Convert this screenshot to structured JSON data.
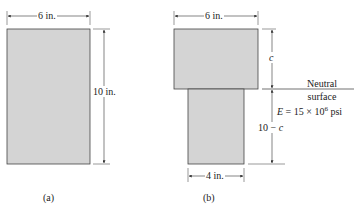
{
  "figure_a": {
    "caption": "(a)",
    "width_label": "6 in.",
    "height_label": "10 in."
  },
  "figure_b": {
    "caption": "(b)",
    "top_width_label": "6 in.",
    "bottom_width_label": "4 in.",
    "upper_height_label": "c",
    "lower_height_prefix": "10 − ",
    "lower_height_var": "c",
    "neutral_line1": "Neutral",
    "neutral_line2": "surface",
    "modulus_E": "E",
    "modulus_text": " = 15 × 10",
    "modulus_exp": "6",
    "modulus_unit": " psi"
  },
  "colors": {
    "fill": "#d4d4d4",
    "stroke": "#444444"
  }
}
